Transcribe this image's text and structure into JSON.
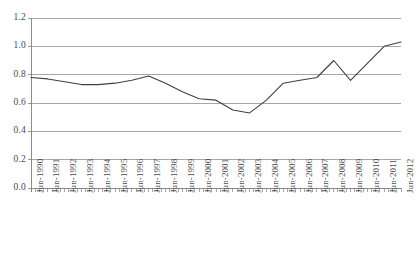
{
  "chart_data": {
    "type": "line",
    "title": "",
    "xlabel": "",
    "ylabel": "",
    "ylim": [
      0.0,
      1.2
    ],
    "ytick_labels": [
      "0.0",
      "0.2",
      "0.4",
      "0.6",
      "0.8",
      "1.0",
      "1.2"
    ],
    "ytick_values": [
      0.0,
      0.2,
      0.4,
      0.6,
      0.8,
      1.0,
      1.2
    ],
    "grid": true,
    "legend": "none",
    "line_color": "#404040",
    "grid_color": "#808080",
    "axis_color": "#808080",
    "categories": [
      "Jun-1990",
      "Jun-1991",
      "Jun-1992",
      "Jun-1993",
      "Jun-1994",
      "Jun-1995",
      "Jun-1996",
      "Jun-1997",
      "Jun-1998",
      "Jun-1999",
      "Jun-2000",
      "Jun-2001",
      "Jun-2002",
      "Jun-2003",
      "Jun-2004",
      "Jun-2005",
      "Jun-2006",
      "Jun-2007",
      "Jun-2008",
      "Jun-2009",
      "Jun-2010",
      "Jun-2011",
      "Jun-2012"
    ],
    "values": [
      0.78,
      0.77,
      0.75,
      0.73,
      0.73,
      0.74,
      0.76,
      0.79,
      0.74,
      0.68,
      0.63,
      0.62,
      0.55,
      0.53,
      0.62,
      0.74,
      0.76,
      0.78,
      0.9,
      0.76,
      0.88,
      1.0,
      1.03
    ],
    "series_name": "Ratio",
    "xtick_minor_per_category": 4
  }
}
